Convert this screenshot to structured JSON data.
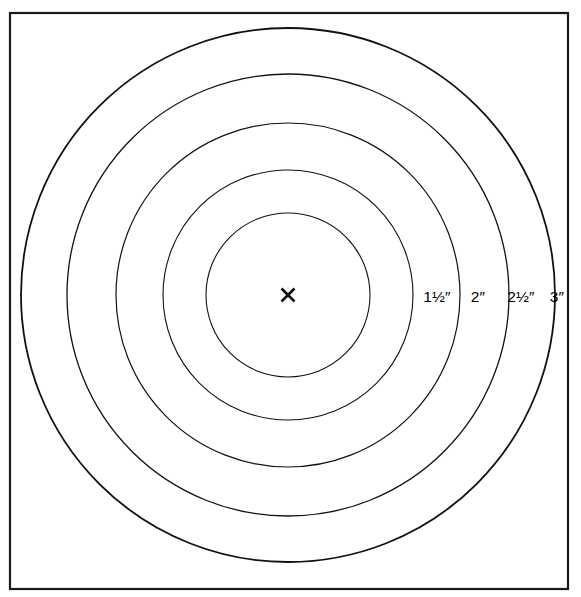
{
  "figure": {
    "name": "concentric-ring-target-diagram",
    "background_color": "#ffffff",
    "stroke_color": "#111111",
    "frame": {
      "x": 10,
      "y": 13,
      "width": 558,
      "height": 576,
      "stroke_width": 2.2
    },
    "center": {
      "x": 288,
      "y": 295,
      "mark": "x-cross",
      "mark_size": 13
    },
    "rings": [
      {
        "index": 1,
        "radius": 82,
        "stroke_width": 1.1,
        "label": "",
        "labeled": false
      },
      {
        "index": 2,
        "radius": 125,
        "stroke_width": 1.1,
        "label": "1½″",
        "labeled": true
      },
      {
        "index": 3,
        "radius": 172,
        "stroke_width": 1.2,
        "label": "2″",
        "labeled": true
      },
      {
        "index": 4,
        "radius": 221,
        "stroke_width": 1.3,
        "label": "2½″",
        "labeled": true
      },
      {
        "index": 5,
        "radius": 267,
        "stroke_width": 1.8,
        "label": "3″",
        "labeled": true
      }
    ],
    "labels": [
      {
        "text": "1½″",
        "x": 437,
        "y": 297,
        "ring_index": 2
      },
      {
        "text": "2″",
        "x": 478,
        "y": 297,
        "ring_index": 3
      },
      {
        "text": "2½″",
        "x": 521,
        "y": 297,
        "ring_index": 4
      },
      {
        "text": "3″",
        "x": 557,
        "y": 297,
        "ring_index": 5
      }
    ]
  },
  "chart_data": {
    "type": "scatter",
    "title": "",
    "subtitle": "",
    "xlabel": "",
    "ylabel": "",
    "grid": false,
    "legend": "none",
    "categories": [
      "ring-1",
      "ring-2",
      "ring-3",
      "ring-4",
      "ring-5"
    ],
    "values": [
      82,
      125,
      172,
      221,
      267
    ],
    "annotations": [
      "1½″",
      "2″",
      "2½″",
      "3″"
    ],
    "center_point": {
      "x": 288,
      "y": 295,
      "marker": "x"
    },
    "xlim": [
      10,
      568
    ],
    "ylim": [
      13,
      589
    ]
  }
}
